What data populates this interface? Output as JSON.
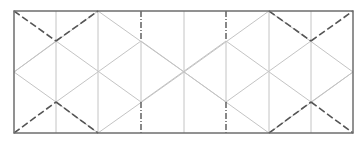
{
  "diagram": {
    "type": "crease-pattern",
    "canvas": {
      "width": 363,
      "height": 143,
      "background": "#ffffff"
    },
    "colors": {
      "border": "#6e6e6e",
      "crease_light": "#c4c4c4",
      "mountain": "#555555",
      "valley": "#555555"
    },
    "border": {
      "x1": 14,
      "y1": 11,
      "x2": 353,
      "y2": 133
    },
    "grid_x": [
      14,
      56,
      98,
      141,
      184,
      226,
      269,
      311,
      353
    ],
    "grid_y": [
      11,
      41,
      72,
      102,
      133
    ],
    "light_verticals": [
      56,
      98,
      184,
      269,
      311
    ],
    "dashdot_verticals": [
      141,
      226
    ],
    "light_diagonals": [
      [
        14,
        72,
        98,
        11
      ],
      [
        14,
        72,
        56,
        102
      ],
      [
        56,
        102,
        98,
        133
      ],
      [
        56,
        41,
        141,
        102
      ],
      [
        98,
        11,
        184,
        72
      ],
      [
        98,
        133,
        184,
        72
      ],
      [
        56,
        102,
        141,
        41
      ],
      [
        141,
        41,
        226,
        102
      ],
      [
        141,
        102,
        226,
        41
      ],
      [
        184,
        72,
        269,
        11
      ],
      [
        184,
        72,
        269,
        133
      ],
      [
        226,
        41,
        311,
        102
      ],
      [
        226,
        102,
        311,
        41
      ],
      [
        269,
        11,
        353,
        72
      ],
      [
        269,
        133,
        353,
        72
      ],
      [
        14,
        72,
        56,
        41
      ],
      [
        311,
        102,
        353,
        72
      ]
    ],
    "dashed_diagonals": [
      [
        14,
        11,
        56,
        41
      ],
      [
        56,
        41,
        98,
        11
      ],
      [
        14,
        133,
        56,
        102
      ],
      [
        56,
        102,
        98,
        133
      ],
      [
        269,
        11,
        311,
        41
      ],
      [
        311,
        41,
        353,
        11
      ],
      [
        269,
        133,
        311,
        102
      ],
      [
        311,
        102,
        353,
        133
      ]
    ]
  }
}
